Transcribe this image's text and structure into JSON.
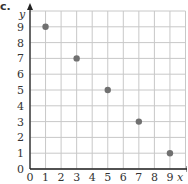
{
  "problem_label": "c.",
  "chart_data": {
    "type": "scatter",
    "title": "",
    "xlabel": "x",
    "ylabel": "y",
    "xlim": [
      0,
      10
    ],
    "ylim": [
      0,
      10
    ],
    "grid": true,
    "x_ticks": [
      0,
      1,
      2,
      3,
      4,
      5,
      6,
      7,
      8,
      9
    ],
    "y_ticks": [
      0,
      1,
      2,
      3,
      4,
      5,
      6,
      7,
      8,
      9
    ],
    "series": [
      {
        "name": "points",
        "color": "#707070",
        "points": [
          {
            "x": 1,
            "y": 9
          },
          {
            "x": 3,
            "y": 7
          },
          {
            "x": 5,
            "y": 5
          },
          {
            "x": 7,
            "y": 3
          },
          {
            "x": 9,
            "y": 1
          }
        ]
      }
    ]
  },
  "colors": {
    "grid": "#c8c8c8",
    "axis": "#222222",
    "text": "#333333"
  }
}
